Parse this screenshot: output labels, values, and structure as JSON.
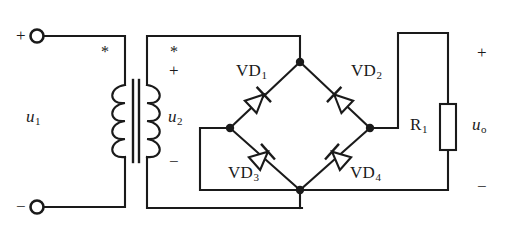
{
  "diagram": {
    "type": "schematic",
    "width": 505,
    "height": 240,
    "background_color": "#ffffff",
    "line_color": "#1a1a1a"
  },
  "labels": {
    "input_voltage": "u",
    "input_voltage_sub": "1",
    "secondary_voltage": "u",
    "secondary_voltage_sub": "2",
    "output_voltage": "u",
    "output_voltage_sub": "o",
    "resistor": "R",
    "resistor_sub": "1",
    "diode1": "VD",
    "diode1_sub": "1",
    "diode2": "VD",
    "diode2_sub": "2",
    "diode3": "VD",
    "diode3_sub": "3",
    "diode4": "VD",
    "diode4_sub": "4",
    "plus": "+",
    "minus": "−",
    "dot_mark": "*"
  },
  "polarity": {
    "input_top": "+",
    "input_bottom": "−",
    "secondary_top": "+",
    "secondary_bottom": "−",
    "output_top": "+",
    "output_bottom": "−"
  },
  "components": {
    "transformer": {
      "name": "transformer",
      "primary_dot": "*",
      "secondary_dot": "*"
    },
    "diodes": [
      {
        "name": "VD1",
        "position": "upper-left",
        "orientation": "up-right"
      },
      {
        "name": "VD2",
        "position": "upper-right",
        "orientation": "up-left"
      },
      {
        "name": "VD3",
        "position": "lower-left",
        "orientation": "up-right"
      },
      {
        "name": "VD4",
        "position": "lower-right",
        "orientation": "up-left"
      }
    ],
    "resistor": {
      "name": "R1",
      "orientation": "vertical"
    },
    "terminals": [
      {
        "name": "input-positive",
        "symbol": "+"
      },
      {
        "name": "input-negative",
        "symbol": "−"
      }
    ]
  }
}
